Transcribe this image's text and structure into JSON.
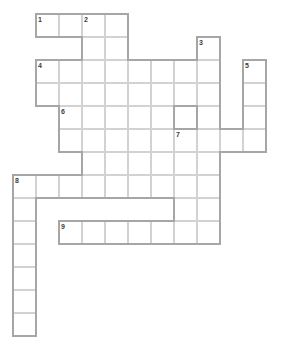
{
  "puzzle": {
    "title": "Crossword Puzzle Grid",
    "type": "crossword-grid",
    "cell_size": 23,
    "origin_x": 13,
    "origin_y": 14,
    "columns": 11,
    "rows": 14,
    "background_color": "#ffffff",
    "cell_fill_color": "#ffffff",
    "cell_border_color": "#d2d2d2",
    "outline_color": "#a6a6a6",
    "number_color": "#3c3c3c",
    "clue_numbers": [
      {
        "label": "1",
        "col": 1,
        "row": 0
      },
      {
        "label": "2",
        "col": 3,
        "row": 0
      },
      {
        "label": "3",
        "col": 8,
        "row": 1
      },
      {
        "label": "4",
        "col": 1,
        "row": 2
      },
      {
        "label": "5",
        "col": 10,
        "row": 2
      },
      {
        "label": "6",
        "col": 2,
        "row": 4
      },
      {
        "label": "7",
        "col": 7,
        "row": 5
      },
      {
        "label": "8",
        "col": 0,
        "row": 7
      },
      {
        "label": "9",
        "col": 2,
        "row": 9
      }
    ],
    "entries": [
      {
        "number": "1",
        "direction": "across",
        "col": 1,
        "row": 0,
        "length": 4
      },
      {
        "number": "2",
        "direction": "down",
        "col": 3,
        "row": 0,
        "length": 5
      },
      {
        "number": "3",
        "direction": "down",
        "col": 8,
        "row": 1,
        "length": 7
      },
      {
        "number": "4",
        "direction": "across",
        "col": 1,
        "row": 2,
        "length": 9
      },
      {
        "number": "5",
        "direction": "down",
        "col": 10,
        "row": 2,
        "length": 4
      },
      {
        "number": "6",
        "direction": "across",
        "col": 2,
        "row": 4,
        "length": 5
      },
      {
        "number": "7",
        "direction": "down",
        "col": 7,
        "row": 5,
        "length": 5
      },
      {
        "number": "7",
        "direction": "across",
        "col": 4,
        "row": 5,
        "length": 4
      },
      {
        "number": "8",
        "direction": "across",
        "col": 0,
        "row": 7,
        "length": 7
      },
      {
        "number": "8",
        "direction": "down",
        "col": 0,
        "row": 7,
        "length": 7
      },
      {
        "number": "9",
        "direction": "across",
        "col": 2,
        "row": 9,
        "length": 7
      }
    ],
    "cells": [
      {
        "col": 1,
        "row": 0
      },
      {
        "col": 2,
        "row": 0
      },
      {
        "col": 3,
        "row": 0
      },
      {
        "col": 4,
        "row": 0
      },
      {
        "col": 3,
        "row": 1
      },
      {
        "col": 4,
        "row": 1
      },
      {
        "col": 8,
        "row": 1
      },
      {
        "col": 1,
        "row": 2
      },
      {
        "col": 2,
        "row": 2
      },
      {
        "col": 3,
        "row": 2
      },
      {
        "col": 4,
        "row": 2
      },
      {
        "col": 5,
        "row": 2
      },
      {
        "col": 6,
        "row": 2
      },
      {
        "col": 7,
        "row": 2
      },
      {
        "col": 8,
        "row": 2
      },
      {
        "col": 10,
        "row": 2
      },
      {
        "col": 1,
        "row": 3
      },
      {
        "col": 2,
        "row": 3
      },
      {
        "col": 3,
        "row": 3
      },
      {
        "col": 4,
        "row": 3
      },
      {
        "col": 5,
        "row": 3
      },
      {
        "col": 6,
        "row": 3
      },
      {
        "col": 7,
        "row": 3
      },
      {
        "col": 8,
        "row": 3
      },
      {
        "col": 10,
        "row": 3
      },
      {
        "col": 3,
        "row": 4
      },
      {
        "col": 4,
        "row": 4
      },
      {
        "col": 8,
        "row": 4
      },
      {
        "col": 10,
        "row": 4
      },
      {
        "col": 2,
        "row": 4
      },
      {
        "col": 5,
        "row": 4
      },
      {
        "col": 6,
        "row": 4
      },
      {
        "col": 2,
        "row": 5
      },
      {
        "col": 3,
        "row": 5
      },
      {
        "col": 4,
        "row": 5
      },
      {
        "col": 5,
        "row": 5
      },
      {
        "col": 6,
        "row": 5
      },
      {
        "col": 7,
        "row": 5
      },
      {
        "col": 8,
        "row": 5
      },
      {
        "col": 9,
        "row": 5
      },
      {
        "col": 10,
        "row": 5
      },
      {
        "col": 3,
        "row": 6
      },
      {
        "col": 4,
        "row": 6
      },
      {
        "col": 5,
        "row": 6
      },
      {
        "col": 6,
        "row": 6
      },
      {
        "col": 7,
        "row": 6
      },
      {
        "col": 8,
        "row": 6
      },
      {
        "col": 0,
        "row": 7
      },
      {
        "col": 1,
        "row": 7
      },
      {
        "col": 2,
        "row": 7
      },
      {
        "col": 3,
        "row": 7
      },
      {
        "col": 4,
        "row": 7
      },
      {
        "col": 5,
        "row": 7
      },
      {
        "col": 6,
        "row": 7
      },
      {
        "col": 7,
        "row": 7
      },
      {
        "col": 8,
        "row": 7
      },
      {
        "col": 0,
        "row": 8
      },
      {
        "col": 7,
        "row": 8
      },
      {
        "col": 8,
        "row": 8
      },
      {
        "col": 0,
        "row": 9
      },
      {
        "col": 2,
        "row": 9
      },
      {
        "col": 3,
        "row": 9
      },
      {
        "col": 4,
        "row": 9
      },
      {
        "col": 5,
        "row": 9
      },
      {
        "col": 6,
        "row": 9
      },
      {
        "col": 7,
        "row": 9
      },
      {
        "col": 8,
        "row": 9
      },
      {
        "col": 0,
        "row": 10
      },
      {
        "col": 0,
        "row": 11
      },
      {
        "col": 0,
        "row": 12
      },
      {
        "col": 0,
        "row": 13
      }
    ]
  }
}
